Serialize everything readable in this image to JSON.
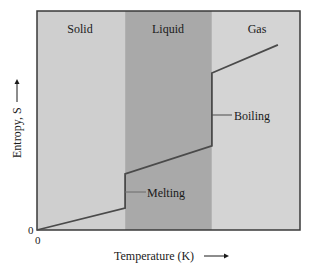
{
  "chart_data": {
    "type": "line",
    "title": "",
    "xlabel": "Temperature (K)",
    "ylabel": "Entropy, S",
    "x_arrow": true,
    "y_arrow": true,
    "xlim": [
      0,
      100
    ],
    "ylim": [
      0,
      100
    ],
    "x_ticks": [
      "0"
    ],
    "y_ticks": [
      "0"
    ],
    "grid": false,
    "legend": null,
    "regions": [
      {
        "name": "Solid",
        "x_start": 0,
        "x_end": 33.5,
        "color": "#cfcfcf"
      },
      {
        "name": "Liquid",
        "x_start": 33.5,
        "x_end": 66.5,
        "color": "#a9a9a9"
      },
      {
        "name": "Gas",
        "x_start": 66.5,
        "x_end": 100,
        "color": "#d4d4d4"
      }
    ],
    "series": [
      {
        "name": "Entropy",
        "color": "#4a4a4a",
        "points": [
          {
            "x": 0,
            "y": 0
          },
          {
            "x": 33.5,
            "y": 10
          },
          {
            "x": 33.5,
            "y": 25.6
          },
          {
            "x": 66.5,
            "y": 38.4
          },
          {
            "x": 66.5,
            "y": 71.7
          },
          {
            "x": 91.6,
            "y": 84.5
          }
        ]
      }
    ],
    "annotations": [
      {
        "text": "Melting",
        "x": 33.5,
        "y": 17.5,
        "leader": true
      },
      {
        "text": "Boiling",
        "x": 66.5,
        "y": 55,
        "leader": true
      }
    ]
  },
  "labels": {
    "x_origin": "0",
    "y_origin": "0",
    "xlabel": "Temperature (K)",
    "ylabel": "Entropy, S",
    "region_solid": "Solid",
    "region_liquid": "Liquid",
    "region_gas": "Gas",
    "melting": "Melting",
    "boiling": "Boiling"
  },
  "colors": {
    "solid_band": "#cfcfcf",
    "liquid_band": "#a9a9a9",
    "gas_band": "#d4d4d4",
    "line": "#4a4a4a",
    "frame": "#3a3a3a"
  }
}
